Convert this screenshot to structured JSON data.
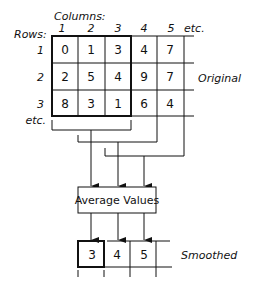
{
  "labels": {
    "columns": "Columns:",
    "rows": "Rows:",
    "col_headers": [
      "1",
      "2",
      "3",
      "4",
      "5",
      "etc."
    ],
    "row_headers": [
      "1",
      "2",
      "3",
      "etc."
    ],
    "original": "Original",
    "smoothed": "Smoothed",
    "average": "Average Values"
  },
  "original_grid": [
    [
      "0",
      "1",
      "3",
      "4",
      "7"
    ],
    [
      "2",
      "5",
      "4",
      "9",
      "7"
    ],
    [
      "8",
      "3",
      "1",
      "6",
      "4"
    ]
  ],
  "smoothed_row": [
    "3",
    "4",
    "5"
  ]
}
